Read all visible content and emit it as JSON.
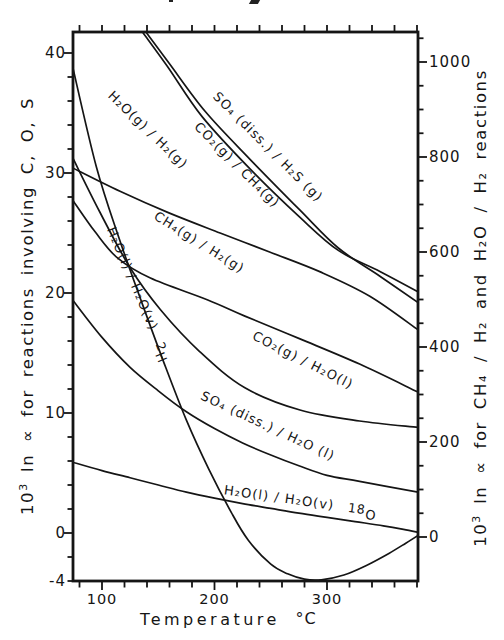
{
  "titles": {
    "left_axis": {
      "base": "10",
      "sup": "3",
      "rest": " ln ∝ for reactions involving C, O, S"
    },
    "right_axis": {
      "base": "10",
      "sup": "3",
      "rest": " ln ∝ for CH₄ / H₂ and H₂O / H₂ reactions"
    },
    "x_axis": {
      "label": "Temperature",
      "unit": "°C"
    }
  },
  "colors": {
    "ink": "#151515",
    "background": "#ffffff"
  },
  "chart_data": {
    "type": "line",
    "title": "",
    "x": {
      "label": "Temperature",
      "unit": "°C",
      "range": [
        74.2,
        381
      ],
      "ticks": [
        "100",
        "200",
        "300"
      ],
      "tick_values": [
        100,
        200,
        300
      ],
      "minor_tick_step": 20
    },
    "y_left": {
      "label": "10³ ln ∝ for reactions involving C, O, S",
      "range": [
        -4,
        41.75
      ],
      "ticks": [
        "40",
        "30",
        "20",
        "10",
        "0",
        "-4"
      ],
      "tick_values": [
        40,
        30,
        20,
        10,
        0,
        -4
      ],
      "minor_tick_step": 2
    },
    "y_right": {
      "label": "10³ ln ∝ for CH₄ / H₂ and H₂O / H₂ reactions",
      "range": [
        0,
        1063
      ],
      "ticks": [
        "1000",
        "800",
        "600",
        "400",
        "200",
        "0"
      ],
      "tick_values": [
        1000,
        800,
        600,
        400,
        200,
        0
      ],
      "minor_tick_step": 50
    },
    "grid": false,
    "series": [
      {
        "id": "so4-h2s",
        "label": "SO₄ (diss.) / H₂S (g)",
        "axis": "left",
        "points": [
          [
            139,
            41.75
          ],
          [
            160,
            39.1
          ],
          [
            192,
            35.1
          ],
          [
            232,
            31.1
          ],
          [
            276,
            26.9
          ],
          [
            310,
            23.75
          ],
          [
            347,
            21.4
          ],
          [
            381,
            19.2
          ]
        ]
      },
      {
        "id": "co2-ch4",
        "label": "CO₂(g) / CH₄(g)",
        "axis": "left",
        "points": [
          [
            136,
            41.75
          ],
          [
            158,
            38.9
          ],
          [
            189,
            34.7
          ],
          [
            232,
            30.3
          ],
          [
            276,
            26.3
          ],
          [
            310,
            23.55
          ],
          [
            347,
            21.8
          ],
          [
            381,
            20.1
          ]
        ]
      },
      {
        "id": "h2o-g-h2",
        "label": "H₂O(g) / H₂(g)",
        "axis": "right",
        "points": [
          [
            74,
            777
          ],
          [
            116,
            728
          ],
          [
            160,
            682
          ],
          [
            205,
            640
          ],
          [
            249,
            600
          ],
          [
            294,
            558
          ],
          [
            338,
            507
          ],
          [
            381,
            436
          ]
        ]
      },
      {
        "id": "ch4-h2",
        "label": "CH₄(g) / H₂(g)",
        "axis": "right",
        "points": [
          [
            74,
            709
          ],
          [
            94,
            642
          ],
          [
            114,
            587
          ],
          [
            143,
            545
          ],
          [
            194,
            499
          ],
          [
            227,
            465
          ],
          [
            276,
            417
          ],
          [
            329,
            364
          ],
          [
            381,
            305
          ]
        ]
      },
      {
        "id": "co2-h2o",
        "label": "CO₂(g) / H₂O(l)",
        "axis": "left",
        "points": [
          [
            74,
            31.25
          ],
          [
            98,
            26.75
          ],
          [
            125,
            22.1
          ],
          [
            152,
            18.6
          ],
          [
            187,
            15.1
          ],
          [
            227,
            12.1
          ],
          [
            276,
            10.25
          ],
          [
            329,
            9.33
          ],
          [
            381,
            8.8
          ]
        ]
      },
      {
        "id": "so4-h2o",
        "label": "SO₄ (diss.) / H₂O (l)",
        "axis": "left",
        "points": [
          [
            74,
            19.4
          ],
          [
            100,
            16.3
          ],
          [
            125,
            13.8
          ],
          [
            150,
            11.85
          ],
          [
            175,
            10.1
          ],
          [
            200,
            8.7
          ],
          [
            225,
            7.5
          ],
          [
            250,
            6.5
          ],
          [
            275,
            5.6
          ],
          [
            300,
            4.8
          ],
          [
            329,
            4.3
          ],
          [
            381,
            3.4
          ]
        ]
      },
      {
        "id": "h2o-lv-18o",
        "label": "H₂O(l) / H₂O(v)",
        "isotope": {
          "prefix": "18",
          "symbol": "O"
        },
        "axis": "left",
        "points": [
          [
            74,
            5.9
          ],
          [
            100,
            5.2
          ],
          [
            125,
            4.6
          ],
          [
            150,
            4.0
          ],
          [
            175,
            3.4
          ],
          [
            200,
            2.9
          ],
          [
            225,
            2.45
          ],
          [
            250,
            2.05
          ],
          [
            275,
            1.65
          ],
          [
            300,
            1.3
          ],
          [
            325,
            0.95
          ],
          [
            350,
            0.6
          ],
          [
            368,
            0.3
          ],
          [
            381,
            0.05
          ]
        ]
      },
      {
        "id": "h2o-lv-2h",
        "label": "H₂O(l) / H₂O(v)",
        "isotope": {
          "prefix": "2",
          "symbol": "H"
        },
        "axis": "left",
        "points": [
          [
            74,
            38.8
          ],
          [
            95,
            30.5
          ],
          [
            115,
            24.6
          ],
          [
            135,
            19.3
          ],
          [
            155,
            14.2
          ],
          [
            175,
            9.4
          ],
          [
            195,
            5.3
          ],
          [
            215,
            1.7
          ],
          [
            230,
            -0.6
          ],
          [
            250,
            -2.6
          ],
          [
            265,
            -3.4
          ],
          [
            280,
            -3.85
          ],
          [
            295,
            -3.9
          ],
          [
            315,
            -3.5
          ],
          [
            335,
            -2.7
          ],
          [
            355,
            -1.7
          ],
          [
            370,
            -0.85
          ],
          [
            381,
            -0.2
          ]
        ]
      }
    ]
  }
}
